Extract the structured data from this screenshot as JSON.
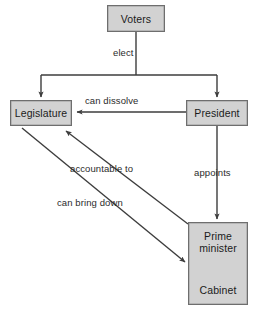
{
  "diagram": {
    "type": "flow-diagram",
    "colors": {
      "box_fill": "#d2d2d2",
      "box_border": "#6e6e6e",
      "line": "#3d3d3d",
      "text": "#1b1b1b",
      "background": "#ffffff"
    },
    "nodes": [
      {
        "id": "voters",
        "label": "Voters"
      },
      {
        "id": "legislature",
        "label": "Legislature"
      },
      {
        "id": "president",
        "label": "President"
      },
      {
        "id": "prime_minister",
        "label": "Prime\nminister",
        "line1": "Prime",
        "line2": "minister"
      },
      {
        "id": "cabinet",
        "label": "Cabinet"
      }
    ],
    "edges": [
      {
        "from": "voters",
        "to": "legislature",
        "label": "elect"
      },
      {
        "from": "voters",
        "to": "president",
        "label": "elect"
      },
      {
        "from": "president",
        "to": "legislature",
        "label": "can dissolve"
      },
      {
        "from": "president",
        "to": "prime_minister",
        "label": "appoints"
      },
      {
        "from": "prime_minister",
        "to": "legislature",
        "label": "accountable to"
      },
      {
        "from": "legislature",
        "to": "prime_minister",
        "label": "can bring down"
      },
      {
        "from": "prime_minister",
        "to": "cabinet",
        "label": ""
      }
    ],
    "labels": {
      "elect": "elect",
      "can_dissolve": "can dissolve",
      "appoints": "appoints",
      "accountable_to": "accountable to",
      "can_bring_down": "can bring down"
    }
  }
}
